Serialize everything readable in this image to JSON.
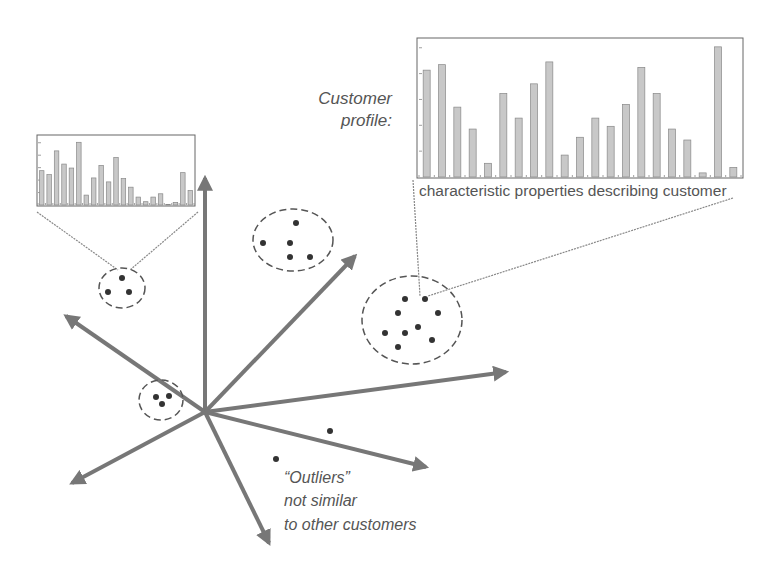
{
  "diagram": {
    "labels": {
      "profile_line1": "Customer",
      "profile_line2": "profile:",
      "chart_caption": "characteristic properties describing customer",
      "outliers_line1": "“Outliers”",
      "outliers_line2": "not similar",
      "outliers_line3": "to other customers"
    },
    "colors": {
      "axis": "#777777",
      "dot": "#333333",
      "bar_fill": "#c8c8c8",
      "bar_stroke": "#888888",
      "text": "#555555"
    },
    "axes_count": 7,
    "clusters": [
      {
        "name": "small-cluster-top-left",
        "points": 3
      },
      {
        "name": "cluster-top-middle",
        "points": 5
      },
      {
        "name": "cluster-right",
        "points": 9
      },
      {
        "name": "cluster-left",
        "points": 3
      }
    ],
    "outlier_points": 2
  },
  "chart_data": [
    {
      "type": "bar",
      "title": "Customer profile (large)",
      "xlabel": "characteristic properties describing customer",
      "ylabel": "",
      "categories": [
        "1",
        "2",
        "3",
        "4",
        "5",
        "6",
        "7",
        "8",
        "9",
        "10",
        "11",
        "12",
        "13",
        "14",
        "15",
        "16",
        "17",
        "18",
        "19",
        "20",
        "21"
      ],
      "values": [
        78,
        82,
        51,
        35,
        10,
        61,
        43,
        68,
        84,
        16,
        29,
        43,
        37,
        53,
        80,
        61,
        35,
        27,
        3,
        95,
        7
      ],
      "ylim": [
        0,
        100
      ],
      "grid": false
    },
    {
      "type": "bar",
      "title": "Customer profile (small)",
      "xlabel": "",
      "ylabel": "",
      "categories": [
        "1",
        "2",
        "3",
        "4",
        "5",
        "6",
        "7",
        "8",
        "9",
        "10",
        "11",
        "12",
        "13",
        "14",
        "15",
        "16",
        "17",
        "18",
        "19",
        "20",
        "21"
      ],
      "values": [
        52,
        46,
        82,
        62,
        56,
        95,
        15,
        41,
        60,
        35,
        72,
        40,
        27,
        12,
        5,
        12,
        17,
        1,
        4,
        49,
        22
      ],
      "ylim": [
        0,
        100
      ],
      "grid": false
    }
  ]
}
